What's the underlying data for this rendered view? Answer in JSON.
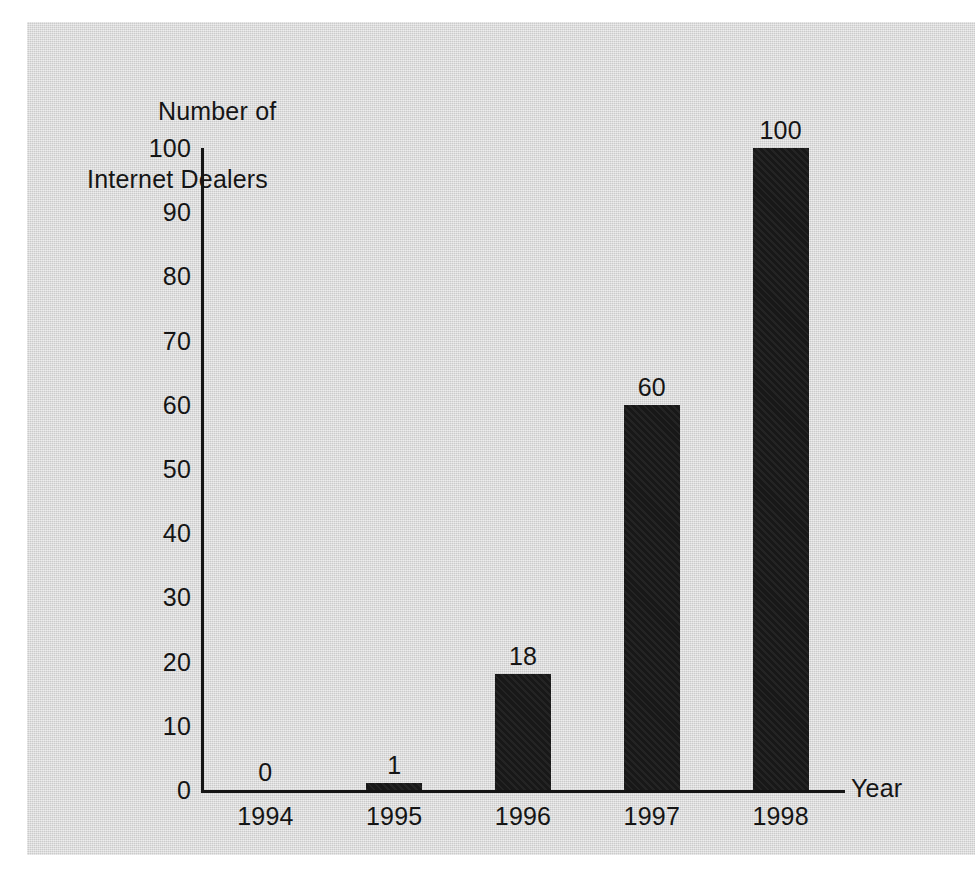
{
  "chart_data": {
    "type": "bar",
    "title": "",
    "ylabel": "Number of\nInternet Dealers",
    "ylabel_line1": "Number of",
    "ylabel_line2": "Internet Dealers",
    "xlabel": "Year",
    "categories": [
      "1994",
      "1995",
      "1996",
      "1997",
      "1998"
    ],
    "values": [
      0,
      1,
      18,
      60,
      100
    ],
    "value_labels": [
      "0",
      "1",
      "18",
      "60",
      "100"
    ],
    "ylim": [
      0,
      100
    ],
    "yticks": [
      0,
      10,
      20,
      30,
      40,
      50,
      60,
      70,
      80,
      90,
      100
    ],
    "ytick_labels": [
      "0",
      "10",
      "20",
      "30",
      "40",
      "50",
      "60",
      "70",
      "80",
      "90",
      "100"
    ],
    "grid": false,
    "legend": false,
    "bar_color": "#181818",
    "background_color": "#d9d9d9",
    "axis_color": "#161616",
    "text_color": "#151515"
  }
}
